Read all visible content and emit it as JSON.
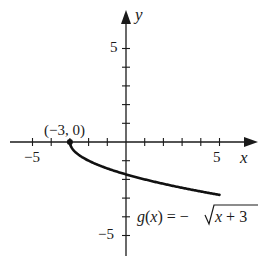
{
  "chart_data": {
    "type": "line",
    "title": "",
    "function_label": "g(x) = −√x + 3",
    "function_parts": {
      "lhs": "g(x) = −",
      "radicand": "x + 3"
    },
    "xlabel": "x",
    "ylabel": "y",
    "xlim": [
      -6,
      6
    ],
    "ylim": [
      -6,
      6
    ],
    "x_tick_labels": [
      {
        "value": -5,
        "label": "−5"
      },
      {
        "value": 5,
        "label": "5"
      }
    ],
    "y_tick_labels": [
      {
        "value": 5,
        "label": "5"
      },
      {
        "value": -5,
        "label": "−5"
      }
    ],
    "ticks_every": 1,
    "grid": false,
    "annotations": [
      {
        "x": -3,
        "y": 0,
        "label": "(−3, 0)",
        "marker": "filled-circle"
      }
    ],
    "series": [
      {
        "name": "g(x) = −√(x+3)",
        "x": [
          -3,
          -2.75,
          -2.5,
          -2,
          -1,
          0,
          1,
          2,
          3,
          4,
          5
        ],
        "y": [
          0,
          -0.5,
          -0.707,
          -1,
          -1.414,
          -1.732,
          -2,
          -2.236,
          -2.449,
          -2.646,
          -2.828
        ]
      }
    ]
  },
  "colors": {
    "axis": "#1a1a1a",
    "curve": "#111111",
    "background": "#ffffff"
  }
}
